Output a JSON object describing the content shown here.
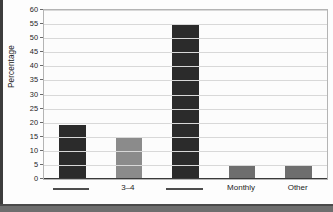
{
  "figure": {
    "ylabel": "Percentage",
    "accent_dark": "#2b2b2b",
    "accent_mid": "#8b8b8b",
    "accent_gray": "#6e6e6e",
    "gridline_color": "#d8d8d8",
    "axis_color": "#3a3a3a",
    "plot_background": "#fcfcfc"
  },
  "chart_data": {
    "type": "bar",
    "title": "",
    "xlabel": "",
    "ylabel": "Percentage",
    "ylim": [
      0,
      60
    ],
    "ytick_step": 5,
    "yticks": [
      0,
      5,
      10,
      15,
      20,
      25,
      30,
      35,
      40,
      45,
      50,
      55,
      60
    ],
    "ytick_labels": [
      "0",
      "5",
      "10",
      "15",
      "20",
      "25",
      "30",
      "35",
      "40",
      "45",
      "50",
      "55",
      "60"
    ],
    "grid": true,
    "legend": false,
    "categories": [
      "———",
      "3–4",
      "———",
      "Monthly",
      "Other"
    ],
    "category_labels_redacted": [
      true,
      false,
      true,
      false,
      false
    ],
    "values": [
      19,
      14.5,
      55,
      5,
      5
    ],
    "bar_colors": [
      "#2b2b2b",
      "#8b8b8b",
      "#2b2b2b",
      "#6e6e6e",
      "#6e6e6e"
    ]
  }
}
